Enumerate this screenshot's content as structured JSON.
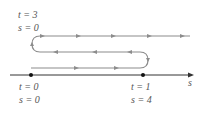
{
  "labels": {
    "start_top": {
      "t": "t = 3",
      "s": "s = 0"
    },
    "origin": {
      "t": "t = 0",
      "s": "s = 0"
    },
    "turn": {
      "t": "t = 1",
      "s": "s = 4"
    },
    "axis": "s"
  },
  "colors": {
    "path": "#8c8c8c",
    "axis": "#333333",
    "dot": "#111111",
    "text": "#555555"
  }
}
